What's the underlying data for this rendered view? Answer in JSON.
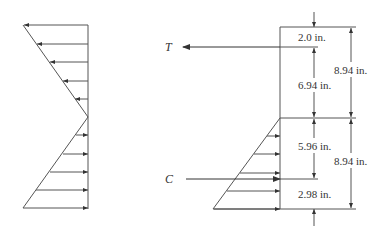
{
  "diagram": {
    "title": "",
    "left_figure": {
      "description": "Linear stress distribution: compression arrows pointing left above neutral axis, tension arrows pointing right below",
      "upper_arrows_count": 5,
      "lower_arrows_count": 5
    },
    "right_figure": {
      "forces": {
        "tension": {
          "symbol": "T"
        },
        "compression": {
          "symbol": "C"
        }
      },
      "dimensions": {
        "top_offset": "2.0 in.",
        "upper_inner": "6.94 in.",
        "upper_total": "8.94 in.",
        "lower_inner": "5.96 in.",
        "lower_bottom": "2.98 in.",
        "lower_total": "8.94 in."
      }
    },
    "colors": {
      "line": "#444444",
      "text": "#333333",
      "background": "#ffffff"
    }
  }
}
